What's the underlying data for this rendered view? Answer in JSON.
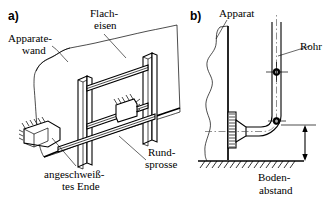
{
  "figure": {
    "type": "technical-line-drawing",
    "language": "de",
    "background_color": "#ffffff",
    "line_color": "#000000",
    "width": 332,
    "height": 201
  },
  "panels": [
    {
      "id": "a",
      "id_label": "a)",
      "view": "isometric",
      "subject": "welded rung frame on apparatus wall",
      "labels": [
        {
          "name": "apparatus-wall",
          "line1": "Apparate-",
          "line2": "wand"
        },
        {
          "name": "flat-iron",
          "line1": "Flach-",
          "line2": "eisen"
        },
        {
          "name": "round-rung",
          "line1": "Rund-",
          "line2": "sprosse"
        },
        {
          "name": "welded-end",
          "line1": "angeschweiß-",
          "line2": "tes Ende"
        }
      ]
    },
    {
      "id": "b",
      "id_label": "b)",
      "view": "elevation",
      "subject": "pipe with elbow on apparatus wall above floor",
      "labels": [
        {
          "name": "apparatus",
          "line1": "Apparat",
          "line2": ""
        },
        {
          "name": "pipe",
          "line1": "Rohr",
          "line2": ""
        },
        {
          "name": "floor-clearance",
          "line1": "Boden-",
          "line2": "abstand"
        }
      ]
    }
  ]
}
